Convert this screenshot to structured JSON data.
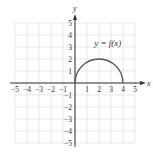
{
  "chart_data": {
    "type": "line",
    "title": "",
    "xlabel": "x",
    "ylabel": "y",
    "xlim": [
      -5,
      5
    ],
    "ylim": [
      -5,
      5
    ],
    "grid": true,
    "x_ticks": [
      -5,
      -4,
      -3,
      -2,
      -1,
      1,
      2,
      3,
      4,
      5
    ],
    "x_tick_labels": [
      "−5",
      "−4",
      "−3",
      "−2",
      "−1",
      "1",
      "2",
      "3",
      "4",
      "5"
    ],
    "y_ticks": [
      1,
      2,
      3,
      4,
      5,
      -1,
      -2,
      -3,
      -4,
      -5
    ],
    "y_tick_labels": [
      "1",
      "2",
      "3",
      "4",
      "5",
      "−1",
      "−2",
      "−3",
      "−4",
      "−5"
    ],
    "series": [
      {
        "name": "y = f(x)",
        "description": "upper semicircle centered at (2, 0) with radius 2",
        "x": [
          0,
          0.5,
          1,
          1.5,
          2,
          2.5,
          3,
          3.5,
          4
        ],
        "y": [
          0,
          1.32,
          1.73,
          1.94,
          2,
          1.94,
          1.73,
          1.32,
          0
        ]
      }
    ],
    "annotations": [
      {
        "text": "y = f(x)",
        "x": 2.6,
        "y": 3.3
      }
    ]
  },
  "colors": {
    "grid": "#d9d9d9",
    "axis": "#333333",
    "curve": "#555555",
    "text": "#333333"
  }
}
